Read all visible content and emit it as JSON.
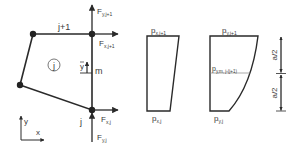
{
  "element": {
    "node_top_label": "j+1",
    "node_bottom_label": "j",
    "element_id": "j",
    "ybar_label": "y",
    "m_label": "m"
  },
  "forces": {
    "fy_top": {
      "main": "F",
      "sub": "y,j+1"
    },
    "fx_top": {
      "main": "F",
      "sub": "x,j+1"
    },
    "fx_bottom": {
      "main": "F",
      "sub": "x,j"
    },
    "fy_bottom": {
      "main": "F",
      "sub": "y,j"
    }
  },
  "axes": {
    "x": "x",
    "y": "y"
  },
  "px_diagram": {
    "top": {
      "main": "p",
      "sub": "x,j+1"
    },
    "bottom": {
      "main": "p",
      "sub": "x,j"
    }
  },
  "py_diagram": {
    "top": {
      "main": "p",
      "sub": "y,j+1"
    },
    "mid": {
      "main": "p",
      "sub": "y,m, j-(j+1)"
    },
    "bottom": {
      "main": "p",
      "sub": "y,j"
    }
  },
  "dimensions": {
    "upper": "a/2",
    "lower": "a/2"
  },
  "colors": {
    "stroke": "#2a2a2a",
    "text": "#3a3a3a",
    "midline": "#888888"
  }
}
